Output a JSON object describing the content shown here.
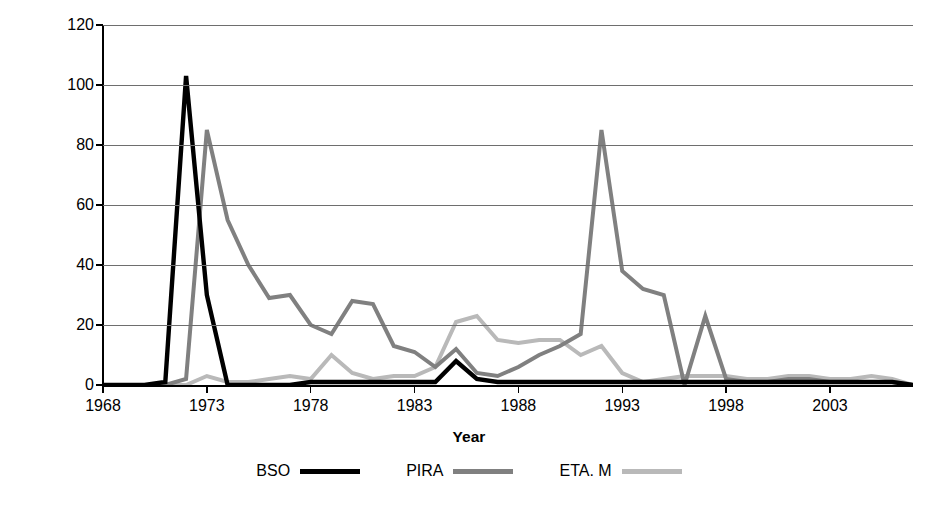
{
  "chart_data": {
    "type": "line",
    "title": "",
    "xlabel": "Year",
    "ylabel": "Number of incidents",
    "xlim": [
      1968,
      2007
    ],
    "ylim": [
      0,
      120
    ],
    "ytick_values": [
      0,
      20,
      40,
      60,
      80,
      100,
      120
    ],
    "ytick_labels": [
      "0",
      "20",
      "40",
      "60",
      "80",
      "100",
      "120"
    ],
    "xtick_values": [
      1968,
      1973,
      1978,
      1983,
      1988,
      1993,
      1998,
      2003
    ],
    "xtick_labels": [
      "1968",
      "1973",
      "1978",
      "1983",
      "1988",
      "1993",
      "1998",
      "2003"
    ],
    "grid": "horizontal",
    "legend_position": "bottom",
    "x": [
      1968,
      1969,
      1970,
      1971,
      1972,
      1973,
      1974,
      1975,
      1976,
      1977,
      1978,
      1979,
      1980,
      1981,
      1982,
      1983,
      1984,
      1985,
      1986,
      1987,
      1988,
      1989,
      1990,
      1991,
      1992,
      1993,
      1994,
      1995,
      1996,
      1997,
      1998,
      1999,
      2000,
      2001,
      2002,
      2003,
      2004,
      2005,
      2006,
      2007
    ],
    "series": [
      {
        "name": "BSO",
        "color": "#000000",
        "values": [
          0,
          0,
          0,
          1,
          103,
          30,
          0,
          0,
          0,
          0,
          1,
          1,
          1,
          1,
          1,
          1,
          1,
          8,
          2,
          1,
          1,
          1,
          1,
          1,
          1,
          1,
          1,
          1,
          1,
          1,
          1,
          1,
          1,
          1,
          1,
          1,
          1,
          1,
          1,
          0
        ]
      },
      {
        "name": "PIRA",
        "color": "#808080",
        "values": [
          0,
          0,
          0,
          0,
          2,
          85,
          55,
          40,
          29,
          30,
          20,
          17,
          28,
          27,
          13,
          11,
          6,
          12,
          4,
          3,
          6,
          10,
          13,
          17,
          85,
          38,
          32,
          30,
          0,
          23,
          2,
          1,
          1,
          2,
          2,
          1,
          1,
          1,
          1,
          0
        ]
      },
      {
        "name": "ETA. M",
        "color": "#b9b9b9",
        "values": [
          0,
          0,
          0,
          0,
          0,
          3,
          1,
          1,
          2,
          3,
          2,
          10,
          4,
          2,
          3,
          3,
          6,
          21,
          23,
          15,
          14,
          15,
          15,
          10,
          13,
          4,
          1,
          2,
          3,
          3,
          3,
          2,
          2,
          3,
          3,
          2,
          2,
          3,
          2,
          0
        ]
      }
    ]
  },
  "axes": {
    "ylabel": "Number of incidents",
    "xlabel": "Year"
  },
  "legend": {
    "items": [
      {
        "label": "BSO",
        "color": "#000000",
        "thickness": "5px"
      },
      {
        "label": "PIRA",
        "color": "#808080",
        "thickness": "5px"
      },
      {
        "label": "ETA. M",
        "color": "#b9b9b9",
        "thickness": "5px"
      }
    ]
  }
}
